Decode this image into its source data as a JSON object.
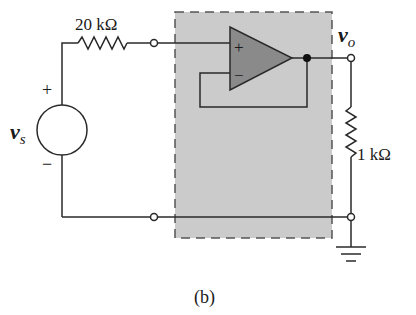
{
  "diagram": {
    "type": "circuit",
    "caption": "(b)",
    "source": {
      "name": "v",
      "subscript": "s",
      "plus": "+",
      "minus": "−"
    },
    "series_resistor": {
      "label": "20 kΩ"
    },
    "load_resistor": {
      "label": "1 kΩ"
    },
    "output": {
      "name": "v",
      "subscript": "o"
    },
    "opamp": {
      "plus_input": "+",
      "minus_input": "−",
      "configuration": "voltage follower (buffer)"
    },
    "colors": {
      "shaded_box": "#c9c9c9",
      "opamp_fill": "#8c8c8c",
      "wire": "#2a2a2a"
    }
  }
}
